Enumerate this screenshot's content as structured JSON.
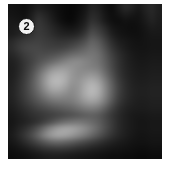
{
  "figure": {
    "panel_label": "2",
    "badge_icon_name": "circle-number-badge",
    "background_color": "#ffffff",
    "image_background_color": "#000000",
    "badge_fill_color": "#f2f2f2",
    "badge_text_color": "#0a0a0a"
  },
  "chart_data": {
    "type": "heatmap",
    "title": "",
    "subtitle": "",
    "xlabel": "",
    "ylabel": "",
    "grid": false,
    "legend_position": "none",
    "colormap": "grayscale",
    "value_min": 0,
    "value_max": 255,
    "nx": 23,
    "ny": 23,
    "x": [
      0,
      1,
      2,
      3,
      4,
      5,
      6,
      7,
      8,
      9,
      10,
      11,
      12,
      13,
      14,
      15,
      16,
      17,
      18,
      19,
      20,
      21,
      22
    ],
    "y": [
      0,
      1,
      2,
      3,
      4,
      5,
      6,
      7,
      8,
      9,
      10,
      11,
      12,
      13,
      14,
      15,
      16,
      17,
      18,
      19,
      20,
      21,
      22
    ],
    "annotations": [
      {
        "text": "2",
        "x": 1.5,
        "y": 1.8,
        "style": "circled-label"
      }
    ],
    "values": [
      [
        18,
        16,
        14,
        22,
        30,
        26,
        20,
        14,
        10,
        8,
        12,
        20,
        34,
        30,
        18,
        12,
        26,
        40,
        34,
        24,
        34,
        40,
        30
      ],
      [
        20,
        18,
        16,
        28,
        42,
        36,
        26,
        16,
        10,
        8,
        14,
        24,
        40,
        36,
        22,
        14,
        20,
        28,
        24,
        20,
        30,
        38,
        30
      ],
      [
        24,
        22,
        20,
        34,
        52,
        44,
        32,
        20,
        12,
        10,
        18,
        30,
        48,
        42,
        26,
        16,
        14,
        18,
        16,
        18,
        26,
        34,
        28
      ],
      [
        26,
        30,
        36,
        44,
        56,
        50,
        40,
        30,
        22,
        20,
        26,
        40,
        62,
        56,
        40,
        24,
        18,
        16,
        14,
        16,
        22,
        28,
        26
      ],
      [
        28,
        34,
        42,
        50,
        58,
        54,
        46,
        38,
        34,
        34,
        40,
        56,
        78,
        70,
        52,
        32,
        22,
        18,
        16,
        16,
        20,
        24,
        24
      ],
      [
        40,
        50,
        58,
        62,
        64,
        60,
        56,
        52,
        52,
        56,
        64,
        78,
        96,
        88,
        66,
        44,
        30,
        24,
        20,
        18,
        20,
        22,
        22
      ],
      [
        44,
        56,
        66,
        70,
        70,
        66,
        64,
        64,
        68,
        76,
        86,
        98,
        108,
        100,
        78,
        54,
        38,
        28,
        22,
        20,
        20,
        22,
        22
      ],
      [
        38,
        48,
        60,
        68,
        74,
        76,
        80,
        86,
        96,
        106,
        112,
        116,
        118,
        110,
        88,
        64,
        46,
        34,
        26,
        22,
        22,
        24,
        24
      ],
      [
        32,
        40,
        54,
        66,
        80,
        92,
        104,
        116,
        128,
        136,
        138,
        132,
        124,
        114,
        94,
        70,
        50,
        36,
        28,
        24,
        24,
        26,
        26
      ],
      [
        30,
        38,
        54,
        72,
        94,
        118,
        140,
        152,
        154,
        148,
        140,
        134,
        130,
        122,
        100,
        74,
        52,
        38,
        30,
        26,
        26,
        28,
        28
      ],
      [
        30,
        40,
        58,
        80,
        110,
        142,
        168,
        176,
        170,
        152,
        142,
        146,
        150,
        140,
        112,
        82,
        56,
        40,
        32,
        28,
        28,
        30,
        30
      ],
      [
        32,
        44,
        62,
        86,
        116,
        150,
        178,
        184,
        172,
        150,
        148,
        162,
        172,
        160,
        128,
        92,
        62,
        44,
        34,
        30,
        30,
        32,
        32
      ],
      [
        34,
        46,
        64,
        86,
        112,
        142,
        166,
        170,
        158,
        142,
        148,
        170,
        184,
        172,
        136,
        98,
        66,
        46,
        36,
        32,
        32,
        34,
        34
      ],
      [
        34,
        46,
        62,
        80,
        100,
        122,
        140,
        144,
        138,
        134,
        146,
        168,
        180,
        168,
        134,
        96,
        64,
        46,
        36,
        32,
        32,
        34,
        34
      ],
      [
        32,
        42,
        56,
        70,
        84,
        98,
        110,
        116,
        118,
        122,
        134,
        150,
        158,
        148,
        120,
        86,
        58,
        42,
        34,
        30,
        30,
        32,
        32
      ],
      [
        28,
        36,
        46,
        56,
        66,
        74,
        82,
        88,
        94,
        100,
        110,
        120,
        124,
        116,
        94,
        68,
        48,
        36,
        30,
        28,
        28,
        30,
        30
      ],
      [
        24,
        30,
        38,
        46,
        52,
        58,
        64,
        70,
        76,
        82,
        88,
        94,
        96,
        90,
        74,
        56,
        42,
        32,
        26,
        24,
        24,
        26,
        26
      ],
      [
        22,
        28,
        34,
        42,
        52,
        66,
        82,
        98,
        110,
        116,
        118,
        114,
        106,
        94,
        76,
        58,
        42,
        32,
        26,
        22,
        22,
        24,
        24
      ],
      [
        24,
        34,
        46,
        62,
        84,
        112,
        138,
        156,
        164,
        162,
        152,
        138,
        120,
        100,
        78,
        58,
        42,
        32,
        26,
        22,
        22,
        24,
        24
      ],
      [
        26,
        38,
        54,
        74,
        100,
        130,
        152,
        162,
        160,
        150,
        136,
        120,
        102,
        84,
        66,
        50,
        38,
        30,
        24,
        20,
        20,
        22,
        22
      ],
      [
        22,
        30,
        42,
        56,
        72,
        88,
        100,
        104,
        100,
        92,
        82,
        72,
        62,
        52,
        42,
        34,
        28,
        24,
        20,
        18,
        18,
        20,
        20
      ],
      [
        16,
        20,
        26,
        34,
        42,
        50,
        54,
        56,
        54,
        50,
        44,
        40,
        34,
        30,
        26,
        22,
        20,
        18,
        16,
        14,
        14,
        16,
        16
      ],
      [
        12,
        14,
        16,
        20,
        24,
        28,
        30,
        30,
        28,
        26,
        24,
        22,
        20,
        18,
        16,
        14,
        14,
        12,
        12,
        10,
        10,
        12,
        12
      ]
    ]
  }
}
